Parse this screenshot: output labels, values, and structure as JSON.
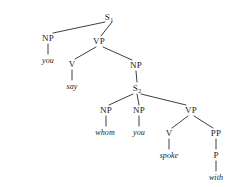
{
  "figure": {
    "kind": "syntax-tree",
    "sentence": "you say whom you spoke with",
    "stroke_color": "#2a2a2a",
    "text_color": "#1b1b1b",
    "background": "#ffffff",
    "width": 242,
    "height": 187
  },
  "nodes": [
    {
      "id": "s1",
      "label": "S",
      "sub": "1",
      "x": 109,
      "y": 17
    },
    {
      "id": "np1",
      "label": "NP",
      "sub": "",
      "x": 48,
      "y": 38
    },
    {
      "id": "vp1",
      "label": "VP",
      "sub": "",
      "x": 99,
      "y": 41
    },
    {
      "id": "v1",
      "label": "V",
      "sub": "",
      "x": 72,
      "y": 64
    },
    {
      "id": "np2",
      "label": "NP",
      "sub": "",
      "x": 136,
      "y": 65
    },
    {
      "id": "s2",
      "label": "S",
      "sub": "2",
      "x": 137,
      "y": 88
    },
    {
      "id": "np3",
      "label": "NP",
      "sub": "",
      "x": 106,
      "y": 110
    },
    {
      "id": "np4",
      "label": "NP",
      "sub": "",
      "x": 139,
      "y": 110
    },
    {
      "id": "vp2",
      "label": "VP",
      "sub": "",
      "x": 191,
      "y": 110
    },
    {
      "id": "v2",
      "label": "V",
      "sub": "",
      "x": 169,
      "y": 133
    },
    {
      "id": "pp1",
      "label": "PP",
      "sub": "",
      "x": 216,
      "y": 133
    },
    {
      "id": "p1",
      "label": "P",
      "sub": "",
      "x": 216,
      "y": 155
    }
  ],
  "leaves": [
    {
      "id": "leaf-you-1",
      "label": "you",
      "x": 48,
      "y": 60
    },
    {
      "id": "leaf-say",
      "label": "say",
      "x": 72,
      "y": 86
    },
    {
      "id": "leaf-whom",
      "label": "whom",
      "x": 105,
      "y": 132
    },
    {
      "id": "leaf-you-2",
      "label": "you",
      "x": 139,
      "y": 132
    },
    {
      "id": "leaf-spoke",
      "label": "spoke",
      "x": 169,
      "y": 155
    },
    {
      "id": "leaf-with",
      "label": "with",
      "x": 216,
      "y": 177
    }
  ],
  "edges": [
    {
      "from": "s1",
      "to": "np1",
      "x1": 105,
      "y1": 22,
      "x2": 53,
      "y2": 33
    },
    {
      "from": "s1",
      "to": "vp1",
      "x1": 112,
      "y1": 22,
      "x2": 101,
      "y2": 36
    },
    {
      "from": "np1",
      "to": "leaf-you-1",
      "x1": 48,
      "y1": 44,
      "x2": 48,
      "y2": 54
    },
    {
      "from": "vp1",
      "to": "v1",
      "x1": 96,
      "y1": 47,
      "x2": 75,
      "y2": 59
    },
    {
      "from": "vp1",
      "to": "np2",
      "x1": 103,
      "y1": 47,
      "x2": 132,
      "y2": 60
    },
    {
      "from": "v1",
      "to": "leaf-say",
      "x1": 72,
      "y1": 70,
      "x2": 72,
      "y2": 80
    },
    {
      "from": "np2",
      "to": "s2",
      "x1": 136,
      "y1": 71,
      "x2": 137,
      "y2": 82
    },
    {
      "from": "s2",
      "to": "np3",
      "x1": 133,
      "y1": 94,
      "x2": 109,
      "y2": 105
    },
    {
      "from": "s2",
      "to": "np4",
      "x1": 137,
      "y1": 94,
      "x2": 139,
      "y2": 105
    },
    {
      "from": "s2",
      "to": "vp2",
      "x1": 141,
      "y1": 94,
      "x2": 186,
      "y2": 105
    },
    {
      "from": "np3",
      "to": "leaf-whom",
      "x1": 106,
      "y1": 116,
      "x2": 106,
      "y2": 126
    },
    {
      "from": "np4",
      "to": "leaf-you-2",
      "x1": 139,
      "y1": 116,
      "x2": 139,
      "y2": 126
    },
    {
      "from": "vp2",
      "to": "v2",
      "x1": 188,
      "y1": 116,
      "x2": 172,
      "y2": 128
    },
    {
      "from": "vp2",
      "to": "pp1",
      "x1": 194,
      "y1": 116,
      "x2": 213,
      "y2": 128
    },
    {
      "from": "v2",
      "to": "leaf-spoke",
      "x1": 169,
      "y1": 139,
      "x2": 169,
      "y2": 149
    },
    {
      "from": "pp1",
      "to": "p1",
      "x1": 216,
      "y1": 139,
      "x2": 216,
      "y2": 149
    },
    {
      "from": "p1",
      "to": "leaf-with",
      "x1": 216,
      "y1": 161,
      "x2": 216,
      "y2": 171
    }
  ]
}
